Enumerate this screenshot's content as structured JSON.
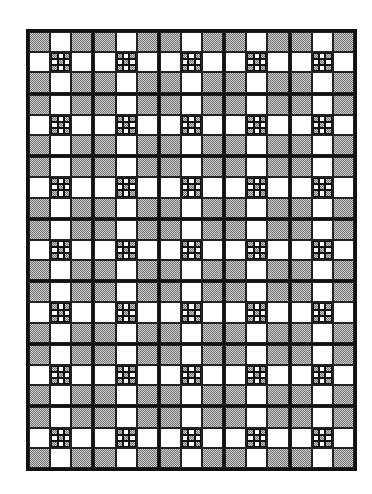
{
  "quilt": {
    "blocks_across": 5,
    "blocks_down": 7,
    "cells_per_block": 3,
    "block_layout": [
      [
        "shaded",
        "white",
        "shaded"
      ],
      [
        "white",
        "ninepatch",
        "white"
      ],
      [
        "shaded",
        "white",
        "shaded"
      ]
    ],
    "ninepatch_layout": [
      [
        "shaded",
        "white",
        "shaded"
      ],
      [
        "white",
        "shaded",
        "white"
      ],
      [
        "shaded",
        "white",
        "shaded"
      ]
    ],
    "colors": {
      "line": "#111111",
      "shade_dark": "#7a7a7a",
      "shade_light": "#c8c8c8",
      "background": "#ffffff"
    }
  }
}
